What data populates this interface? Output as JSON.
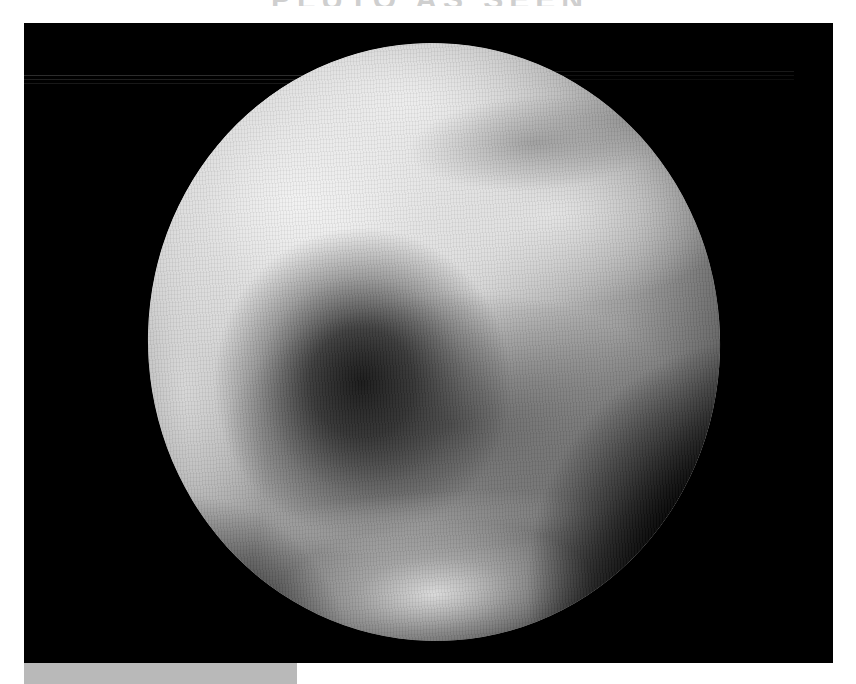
{
  "header": {
    "title_fragment": "PLUTO AS SEEN"
  },
  "image": {
    "subject": "Pluto (grayscale planetary disk)",
    "background_color": "#000000",
    "planet": {
      "center_px": [
        434,
        342
      ],
      "radius_x_px": 286,
      "radius_y_px": 299,
      "features": [
        {
          "name": "dark-region-center",
          "tone": "dark"
        },
        {
          "name": "bright-region-northwest",
          "tone": "bright"
        },
        {
          "name": "bright-region-south",
          "tone": "bright"
        },
        {
          "name": "shadowed-limb-southeast",
          "tone": "dark"
        }
      ]
    }
  },
  "footer": {
    "caption_box_color": "#b9b9b9"
  }
}
